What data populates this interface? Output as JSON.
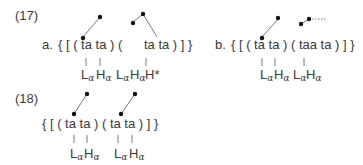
{
  "examples": [
    {
      "number": "(17)",
      "items": [
        {
          "label": "a.",
          "bracketed": "{ [ ( ta ta ) (      ta ta ) ] }",
          "tones": [
            {
              "base": "L",
              "sub": "α"
            },
            {
              "base": "H",
              "sub": "α"
            },
            {
              "base": "L",
              "sub": "α"
            },
            {
              "base": "H",
              "sub": "α"
            },
            {
              "base": "H*",
              "sub": ""
            }
          ]
        },
        {
          "label": "b.",
          "bracketed": "{ [ ( ta ta ) ( taa ta ) ] }",
          "tones": [
            {
              "base": "L",
              "sub": "α"
            },
            {
              "base": "H",
              "sub": "α"
            },
            {
              "base": "L",
              "sub": "α"
            },
            {
              "base": "H",
              "sub": "α"
            }
          ]
        }
      ]
    },
    {
      "number": "(18)",
      "items": [
        {
          "label": "",
          "bracketed": "{ [ ( ta ta ) ( ta ta ) ] }",
          "tones": [
            {
              "base": "L",
              "sub": "α"
            },
            {
              "base": "H",
              "sub": "α"
            },
            {
              "base": "L",
              "sub": "α"
            },
            {
              "base": "H",
              "sub": "α"
            }
          ]
        }
      ]
    }
  ],
  "colors": {
    "text": "#3a3a3a",
    "line": "#7a7a7a",
    "dot": "#111111"
  }
}
